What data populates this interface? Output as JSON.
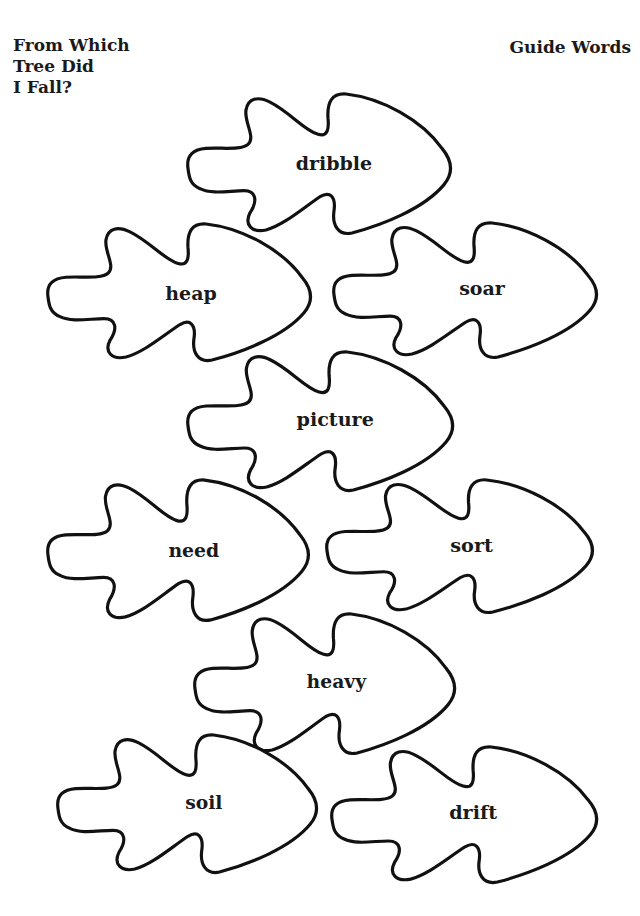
{
  "header": {
    "title_lines": [
      "From Which",
      "Tree Did",
      "I Fall?"
    ],
    "subject": "Guide Words"
  },
  "leaves": [
    {
      "word": "dribble",
      "x": 186,
      "y": 92,
      "w": 266,
      "h": 141
    },
    {
      "word": "heap",
      "x": 46,
      "y": 222,
      "w": 266,
      "h": 138
    },
    {
      "word": "soar",
      "x": 332,
      "y": 221,
      "w": 266,
      "h": 136
    },
    {
      "word": "picture",
      "x": 186,
      "y": 350,
      "w": 268,
      "h": 140
    },
    {
      "word": "need",
      "x": 46,
      "y": 478,
      "w": 264,
      "h": 142
    },
    {
      "word": "sort",
      "x": 325,
      "y": 478,
      "w": 269,
      "h": 134
    },
    {
      "word": "heavy",
      "x": 193,
      "y": 612,
      "w": 263,
      "h": 141
    },
    {
      "word": "soil",
      "x": 56,
      "y": 733,
      "w": 262,
      "h": 139
    },
    {
      "word": "drift",
      "x": 330,
      "y": 745,
      "w": 268,
      "h": 137
    }
  ],
  "style": {
    "outline_color": "#111111",
    "background": "#ffffff"
  }
}
